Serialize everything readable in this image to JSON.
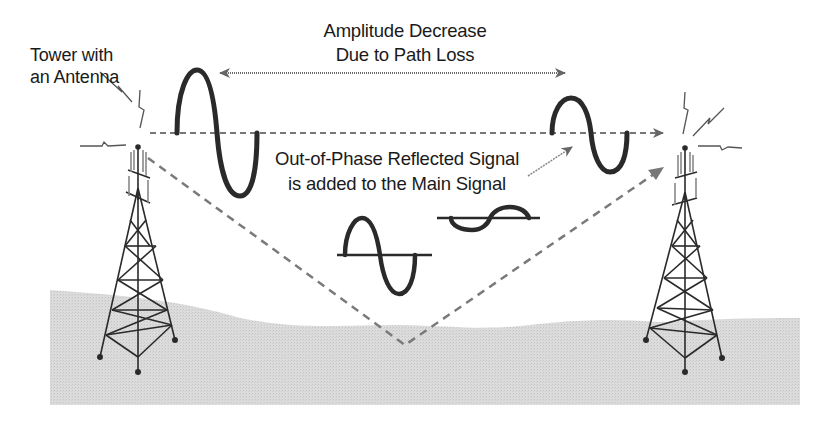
{
  "diagram": {
    "title_line1": "Amplitude Decrease",
    "title_line2": "Due to Path Loss",
    "tower_label_line1": "Tower with",
    "tower_label_line2": "an Antenna",
    "reflection_label_line1": "Out-of-Phase Reflected Signal",
    "reflection_label_line2": "is added to the Main Signal",
    "elements": {
      "left_tower": "transmit-tower-icon",
      "right_tower": "receive-tower-icon",
      "direct_path": "dashed line between antennas",
      "reflected_path": "dashed V-shaped path bouncing off ground",
      "large_wave": "strong main signal near transmitter",
      "small_wave": "attenuated main signal near receiver",
      "in_phase_wave": "main signal component",
      "reflected_wave": "out-of-phase reflected component"
    },
    "colors": {
      "line": "#2a2a2a",
      "dash": "#7a7a7a",
      "ground": "#d4d4d4"
    }
  }
}
